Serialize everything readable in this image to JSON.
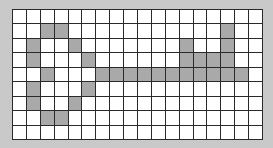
{
  "grid": {
    "rows": 9,
    "cols": 18,
    "colors": {
      "background": "#c9c9c9",
      "empty": "#ffffff",
      "filled": "#a9a9a9",
      "line": "#2a2a2a"
    },
    "filled_cells": [
      [
        1,
        2
      ],
      [
        1,
        3
      ],
      [
        1,
        15
      ],
      [
        2,
        1
      ],
      [
        2,
        4
      ],
      [
        2,
        12
      ],
      [
        2,
        15
      ],
      [
        3,
        1
      ],
      [
        3,
        5
      ],
      [
        3,
        12
      ],
      [
        3,
        13
      ],
      [
        3,
        14
      ],
      [
        3,
        15
      ],
      [
        4,
        2
      ],
      [
        4,
        6
      ],
      [
        4,
        7
      ],
      [
        4,
        8
      ],
      [
        4,
        9
      ],
      [
        4,
        10
      ],
      [
        4,
        11
      ],
      [
        4,
        12
      ],
      [
        4,
        13
      ],
      [
        4,
        14
      ],
      [
        4,
        15
      ],
      [
        4,
        16
      ],
      [
        5,
        1
      ],
      [
        5,
        5
      ],
      [
        6,
        1
      ],
      [
        6,
        4
      ],
      [
        7,
        2
      ],
      [
        7,
        3
      ]
    ]
  }
}
